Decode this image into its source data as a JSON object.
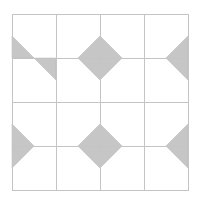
{
  "diagram": {
    "type": "tiling-grid",
    "width": 199,
    "height": 203,
    "grid": {
      "rows": 4,
      "cols": 4,
      "x_lines": [
        12,
        56,
        100,
        144,
        188
      ],
      "y_lines": [
        14,
        58,
        102,
        146,
        190
      ],
      "stroke": "#c4c4c4",
      "stroke_width": 1
    },
    "fill_color": "#c6c6c6",
    "fill_stroke": "#b4b4b4",
    "shapes": [
      {
        "name": "top-left-upper-triangle",
        "points": "12,36 12,58 34,58"
      },
      {
        "name": "top-left-lower-triangle",
        "points": "34,58 56,58 56,80"
      },
      {
        "name": "top-center-diamond",
        "points": "78,58 100,36 122,58 100,80"
      },
      {
        "name": "top-right-triangle",
        "points": "188,36 166,58 188,80"
      },
      {
        "name": "bottom-left-triangle",
        "points": "12,124 34,146 12,168"
      },
      {
        "name": "bottom-center-diamond",
        "points": "78,146 100,124 122,146 100,168"
      },
      {
        "name": "bottom-right-triangle",
        "points": "188,124 166,146 188,168"
      }
    ]
  }
}
